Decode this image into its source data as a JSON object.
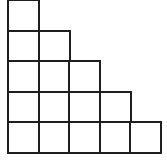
{
  "diagram": {
    "title": "",
    "type": "staircase-grid",
    "rows": [
      1,
      2,
      3,
      4,
      5
    ],
    "total_squares": 15,
    "line_color": "#1e1e1e",
    "background": "#ffffff",
    "origin_x": 8,
    "origin_y": 0,
    "cell_size": 30.6
  }
}
